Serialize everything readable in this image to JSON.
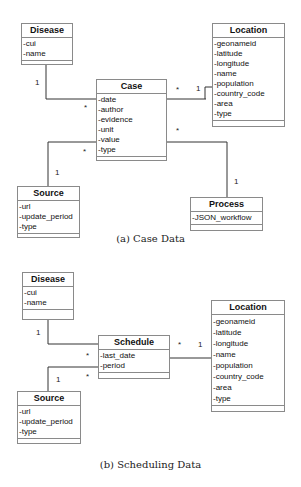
{
  "figures": [
    {
      "caption": "(a) Case Data",
      "classes": {
        "disease": {
          "name": "Disease",
          "attributes": [
            "-cui",
            "-name"
          ]
        },
        "case": {
          "name": "Case",
          "attributes": [
            "-date",
            "-author",
            "-evidence",
            "-unit",
            "-value",
            "-type"
          ]
        },
        "location": {
          "name": "Location",
          "attributes": [
            "-geonameid",
            "-latitude",
            "-longitude",
            "-name",
            "-population",
            "-country_code",
            "-area",
            "-type"
          ]
        },
        "source": {
          "name": "Source",
          "attributes": [
            "-url",
            "-update_period",
            "-type"
          ]
        },
        "process": {
          "name": "Process",
          "attributes": [
            "-JSON_workflow"
          ]
        }
      },
      "associations": [
        {
          "from": "Disease",
          "to": "Case",
          "from_mult": "1",
          "to_mult": "*"
        },
        {
          "from": "Location",
          "to": "Case",
          "from_mult": "1",
          "to_mult": "*"
        },
        {
          "from": "Source",
          "to": "Case",
          "from_mult": "1",
          "to_mult": "*"
        },
        {
          "from": "Process",
          "to": "Case",
          "from_mult": "1",
          "to_mult": "*"
        }
      ]
    },
    {
      "caption": "(b) Scheduling Data",
      "classes": {
        "disease": {
          "name": "Disease",
          "attributes": [
            "-cui",
            "-name"
          ]
        },
        "schedule": {
          "name": "Schedule",
          "attributes": [
            "-last_date",
            "-period"
          ]
        },
        "location": {
          "name": "Location",
          "attributes": [
            "-geonameid",
            "-latitude",
            "-longitude",
            "-name",
            "-population",
            "-country_code",
            "-area",
            "-type"
          ]
        },
        "source": {
          "name": "Source",
          "attributes": [
            "-url",
            "-update_period",
            "-type"
          ]
        }
      },
      "associations": [
        {
          "from": "Disease",
          "to": "Schedule",
          "from_mult": "1",
          "to_mult": "*"
        },
        {
          "from": "Location",
          "to": "Schedule",
          "from_mult": "1",
          "to_mult": "*"
        },
        {
          "from": "Source",
          "to": "Schedule",
          "from_mult": "1",
          "to_mult": "*"
        }
      ]
    }
  ],
  "mult": {
    "one": "1",
    "many": "*"
  }
}
